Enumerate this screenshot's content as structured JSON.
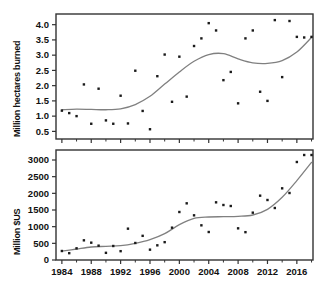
{
  "figure": {
    "title": "",
    "background": "#ffffff",
    "width": 329,
    "height": 302,
    "point_color": "#1a1a1a",
    "line_color": "#808080",
    "axis_color": "#333333"
  },
  "chart_data": [
    {
      "type": "scatter",
      "panel": "top",
      "title": "",
      "xlabel": "",
      "ylabel": "Million hectares burned",
      "xlim": [
        1983.2,
        2018.2
      ],
      "ylim": [
        0.25,
        4.35
      ],
      "grid": false,
      "legend": "none",
      "xticks": [
        1984,
        1988,
        1992,
        1996,
        2000,
        2004,
        2008,
        2012,
        2016
      ],
      "xtick_labels": [
        "",
        "",
        "",
        "",
        "",
        "",
        "",
        "",
        ""
      ],
      "xminor_ticks": [
        1986,
        1990,
        1994,
        1998,
        2002,
        2006,
        2010,
        2014,
        2018
      ],
      "yticks": [
        0.5,
        1.0,
        1.5,
        2.0,
        2.5,
        3.0,
        3.5,
        4.0
      ],
      "ytick_labels": [
        "0.5",
        "1.0",
        "1.5",
        "2.0",
        "2.5",
        "3.0",
        "3.5",
        "4.0"
      ],
      "x": [
        1984,
        1985,
        1986,
        1987,
        1988,
        1989,
        1990,
        1991,
        1992,
        1993,
        1994,
        1995,
        1996,
        1997,
        1998,
        1999,
        2000,
        2001,
        2002,
        2003,
        2004,
        2005,
        2006,
        2007,
        2008,
        2009,
        2010,
        2011,
        2012,
        2013,
        2014,
        2015,
        2016,
        2017,
        2018
      ],
      "y": [
        1.18,
        1.1,
        1.0,
        2.04,
        0.75,
        1.9,
        0.86,
        0.75,
        1.67,
        0.76,
        2.49,
        1.17,
        0.57,
        2.31,
        3.02,
        1.47,
        2.95,
        1.64,
        3.3,
        3.55,
        4.05,
        3.81,
        2.18,
        2.45,
        1.42,
        3.55,
        3.81,
        1.8,
        1.5,
        4.15,
        2.28,
        4.12,
        3.6,
        3.58,
        3.6
      ],
      "trend_line": {
        "name": "loess smooth",
        "x": [
          1984,
          1986,
          1988,
          1990,
          1992,
          1994,
          1996,
          1998,
          2000,
          2002,
          2004,
          2006,
          2008,
          2010,
          2012,
          2014,
          2016,
          2018
        ],
        "y": [
          1.21,
          1.23,
          1.22,
          1.21,
          1.24,
          1.38,
          1.65,
          2.05,
          2.45,
          2.8,
          3.02,
          3.05,
          2.88,
          2.75,
          2.73,
          2.82,
          3.1,
          3.58
        ]
      }
    },
    {
      "type": "scatter",
      "panel": "bottom",
      "title": "",
      "xlabel": "",
      "ylabel": "Million $US",
      "xlim": [
        1983.2,
        2018.2
      ],
      "ylim": [
        0,
        3300
      ],
      "grid": false,
      "legend": "none",
      "xticks": [
        1984,
        1988,
        1992,
        1996,
        2000,
        2004,
        2008,
        2012,
        2016
      ],
      "xtick_labels": [
        "1984",
        "1988",
        "1992",
        "1996",
        "2000",
        "2004",
        "2008",
        "2012",
        "2016"
      ],
      "xminor_ticks": [
        1986,
        1990,
        1994,
        1998,
        2002,
        2006,
        2010,
        2014,
        2018
      ],
      "yticks": [
        0,
        500,
        1000,
        1500,
        2000,
        2500,
        3000
      ],
      "ytick_labels": [
        "0",
        "500",
        "1000",
        "1500",
        "2000",
        "2500",
        "3000"
      ],
      "x": [
        1984,
        1985,
        1986,
        1987,
        1988,
        1989,
        1990,
        1991,
        1992,
        1993,
        1994,
        1995,
        1996,
        1997,
        1998,
        1999,
        2000,
        2001,
        2002,
        2003,
        2004,
        2005,
        2006,
        2007,
        2008,
        2009,
        2010,
        2011,
        2012,
        2013,
        2014,
        2015,
        2016,
        2017,
        2018
      ],
      "y": [
        270,
        205,
        350,
        590,
        520,
        430,
        215,
        420,
        265,
        940,
        510,
        725,
        310,
        440,
        535,
        970,
        1440,
        1700,
        1340,
        1040,
        840,
        1730,
        1650,
        1620,
        950,
        835,
        1420,
        1930,
        1800,
        1560,
        2150,
        2010,
        2940,
        3150,
        3150
      ],
      "trend_line": {
        "name": "loess smooth",
        "x": [
          1984,
          1986,
          1988,
          1990,
          1992,
          1994,
          1996,
          1998,
          2000,
          2002,
          2004,
          2006,
          2008,
          2010,
          2012,
          2014,
          2016,
          2018
        ],
        "y": [
          265,
          330,
          390,
          410,
          430,
          500,
          610,
          790,
          1060,
          1250,
          1290,
          1300,
          1310,
          1350,
          1520,
          1880,
          2380,
          2930
        ]
      }
    }
  ]
}
